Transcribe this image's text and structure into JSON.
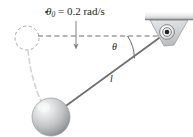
{
  "figure": {
    "type": "physics-diagram",
    "background_color": "#ffffff",
    "labels": {
      "angular_velocity": {
        "symbol": "θ",
        "has_dot": true,
        "subscript": "0",
        "equals": " = ",
        "value": "0.2",
        "units": " rad/s",
        "full_text": "θ̇₀ = 0.2 rad/s"
      },
      "angle": "θ",
      "length": "l"
    },
    "colors": {
      "stroke": "#231f20",
      "rod": "#6d6e71",
      "dashed": "#6d6e71",
      "ghost": "#a7a9ac",
      "bracket_fill": "#d9dadb",
      "bracket_stroke": "#939598",
      "ceiling_top": "#f1f1f2",
      "ceiling_bottom": "#808285",
      "ball_light": "#f2f2f2",
      "ball_mid": "#c6c7c9",
      "ball_dark": "#8b8d8f"
    },
    "geometry": {
      "pivot": {
        "x": 167,
        "y": 32,
        "r_outer": 7.5,
        "r_inner": 4.2,
        "r_pin": 2.2
      },
      "ball": {
        "cx": 51,
        "cy": 117,
        "r": 19
      },
      "ghost_circle": {
        "cx": 27,
        "cy": 38,
        "r": 12
      },
      "dashed_horizontal": {
        "x1": 38,
        "x2": 163,
        "y": 36
      },
      "down_arrow": {
        "x": 76,
        "y1": 21,
        "y2": 49
      },
      "rod": {
        "x1": 167,
        "y1": 32,
        "x2": 51,
        "y2": 117
      },
      "angle_arc": {
        "cx": 167,
        "cy": 32,
        "r": 40,
        "start_deg": 180,
        "end_deg": 216
      },
      "ceiling": {
        "x": 145,
        "y": 12,
        "w": 48,
        "h": 8
      },
      "bracket": {
        "top_left_x": 150,
        "top_right_x": 188,
        "top_y": 20,
        "apex_x": 172,
        "apex_y": 45
      }
    }
  }
}
